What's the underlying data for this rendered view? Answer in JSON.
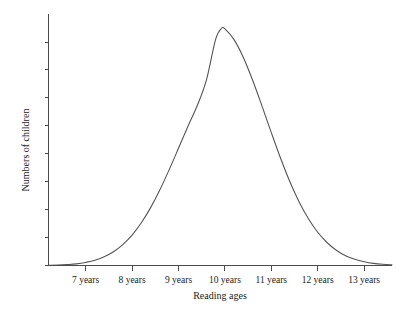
{
  "chart_data": {
    "type": "line",
    "title": "",
    "subtitle": "",
    "xlabel": "Reading ages",
    "ylabel": "Numbers of children",
    "grid": false,
    "legend": "none",
    "x_tick_labels": [
      "7 years",
      "8 years",
      "9 years",
      "10 years",
      "11 years",
      "12 years",
      "13 years"
    ],
    "x_tick_values": [
      7,
      8,
      9,
      10,
      11,
      12,
      13
    ],
    "xlim": [
      6.2,
      13.6
    ],
    "y_tick_labels": [
      "",
      "",
      "",
      "",
      "",
      "",
      "",
      "",
      ""
    ],
    "ylim": [
      0,
      1.06
    ],
    "y_tick_count": 9,
    "annotations": [],
    "series": [
      {
        "name": "Distribution of reading ages",
        "shape": "normal-bell-curve",
        "mean": 9.93,
        "stddev": 0.86,
        "peak_value": 1.0,
        "x": [
          6.2,
          6.4,
          6.6,
          6.8,
          7.0,
          7.2,
          7.4,
          7.6,
          7.8,
          8.0,
          8.2,
          8.4,
          8.6,
          8.8,
          9.0,
          9.2,
          9.4,
          9.6,
          9.8,
          9.93,
          10.0,
          10.2,
          10.4,
          10.6,
          10.8,
          11.0,
          11.2,
          11.4,
          11.6,
          11.8,
          12.0,
          12.2,
          12.4,
          12.6,
          12.8,
          13.0,
          13.2,
          13.4,
          13.6
        ],
        "values": [
          0.001,
          0.002,
          0.004,
          0.007,
          0.013,
          0.022,
          0.037,
          0.058,
          0.088,
          0.128,
          0.18,
          0.244,
          0.319,
          0.404,
          0.494,
          0.585,
          0.672,
          0.78,
          0.953,
          1.0,
          0.997,
          0.951,
          0.876,
          0.78,
          0.672,
          0.56,
          0.452,
          0.353,
          0.268,
          0.197,
          0.14,
          0.097,
          0.064,
          0.041,
          0.026,
          0.016,
          0.009,
          0.005,
          0.003
        ]
      }
    ]
  },
  "colors": {
    "background": "#ffffff",
    "axis": "#4a4a4a",
    "curve": "#555555",
    "text": "#1a1a1a"
  }
}
